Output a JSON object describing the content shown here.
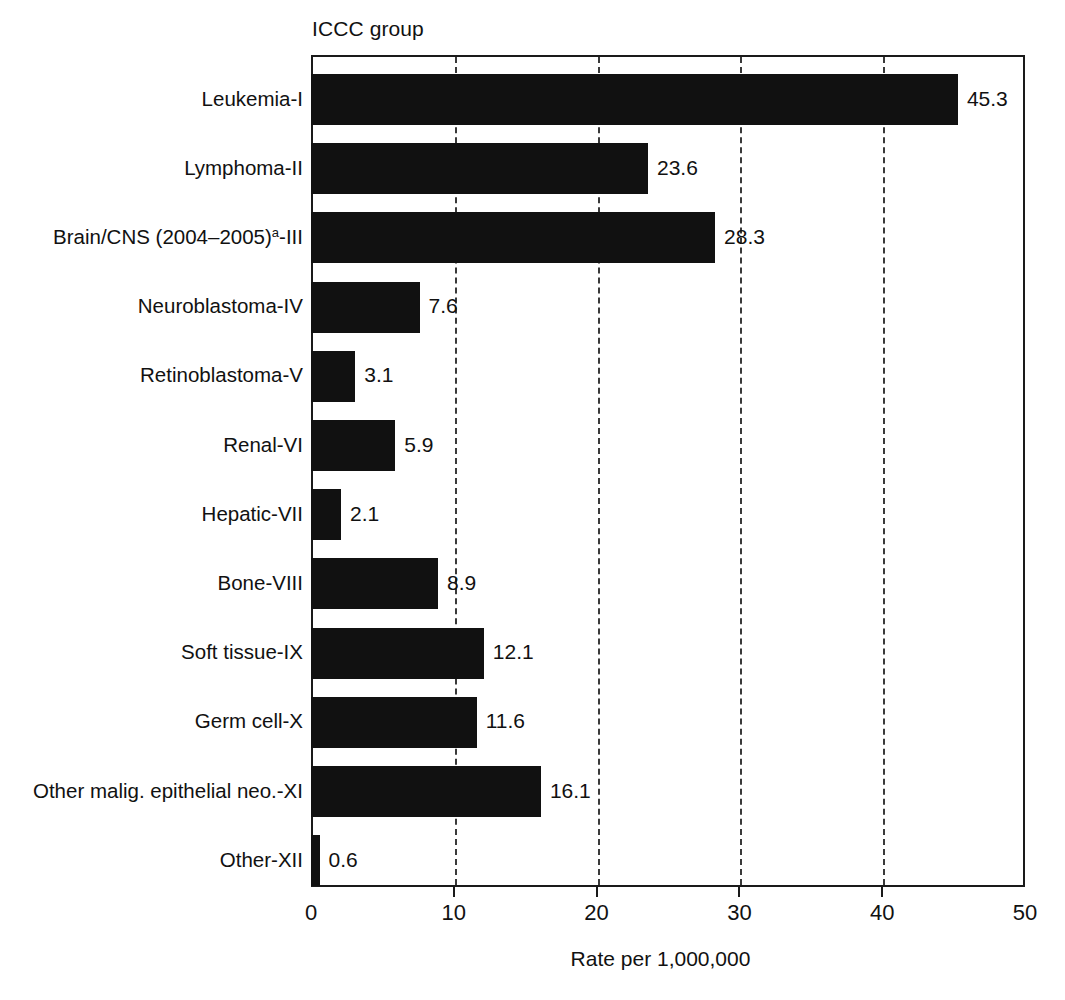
{
  "chart_data": {
    "type": "bar",
    "orientation": "horizontal",
    "title": "",
    "group_axis_title": "ICCC group",
    "xlabel": "Rate per 1,000,000",
    "ylabel": "",
    "xlim": [
      0,
      50
    ],
    "xticks": [
      0,
      10,
      20,
      30,
      40,
      50
    ],
    "xticklabels": [
      "0",
      "10",
      "20",
      "30",
      "40",
      "50"
    ],
    "grid": "vertical-dashed",
    "legend": "none",
    "bar_color": "#111111",
    "categories": [
      "Leukemia-I",
      "Lymphoma-II",
      "Brain/CNS (2004–2005)a-III",
      "Neuroblastoma-IV",
      "Retinoblastoma-V",
      "Renal-VI",
      "Hepatic-VII",
      "Bone-VIII",
      "Soft tissue-IX",
      "Germ cell-X",
      "Other malig. epithelial neo.-XI",
      "Other-XII"
    ],
    "values": [
      45.3,
      23.6,
      28.3,
      7.6,
      3.1,
      5.9,
      2.1,
      8.9,
      12.1,
      11.6,
      16.1,
      0.6
    ],
    "value_labels": [
      "45.3",
      "23.6",
      "28.3",
      "7.6",
      "3.1",
      "5.9",
      "2.1",
      "8.9",
      "12.1",
      "11.6",
      "16.1",
      "0.6"
    ],
    "bars": [
      {
        "label_main": "Leukemia-I",
        "label_sup": "",
        "label_tail": "",
        "value": 45.3,
        "value_label": "45.3"
      },
      {
        "label_main": "Lymphoma-II",
        "label_sup": "",
        "label_tail": "",
        "value": 23.6,
        "value_label": "23.6"
      },
      {
        "label_main": "Brain/CNS (2004–2005)",
        "label_sup": "a",
        "label_tail": "-III",
        "value": 28.3,
        "value_label": "28.3"
      },
      {
        "label_main": "Neuroblastoma-IV",
        "label_sup": "",
        "label_tail": "",
        "value": 7.6,
        "value_label": "7.6"
      },
      {
        "label_main": "Retinoblastoma-V",
        "label_sup": "",
        "label_tail": "",
        "value": 3.1,
        "value_label": "3.1"
      },
      {
        "label_main": "Renal-VI",
        "label_sup": "",
        "label_tail": "",
        "value": 5.9,
        "value_label": "5.9"
      },
      {
        "label_main": "Hepatic-VII",
        "label_sup": "",
        "label_tail": "",
        "value": 2.1,
        "value_label": "2.1"
      },
      {
        "label_main": "Bone-VIII",
        "label_sup": "",
        "label_tail": "",
        "value": 8.9,
        "value_label": "8.9"
      },
      {
        "label_main": "Soft tissue-IX",
        "label_sup": "",
        "label_tail": "",
        "value": 12.1,
        "value_label": "12.1"
      },
      {
        "label_main": "Germ cell-X",
        "label_sup": "",
        "label_tail": "",
        "value": 11.6,
        "value_label": "11.6"
      },
      {
        "label_main": "Other malig. epithelial neo.-XI",
        "label_sup": "",
        "label_tail": "",
        "value": 16.1,
        "value_label": "16.1"
      },
      {
        "label_main": "Other-XII",
        "label_sup": "",
        "label_tail": "",
        "value": 0.6,
        "value_label": "0.6"
      }
    ]
  }
}
